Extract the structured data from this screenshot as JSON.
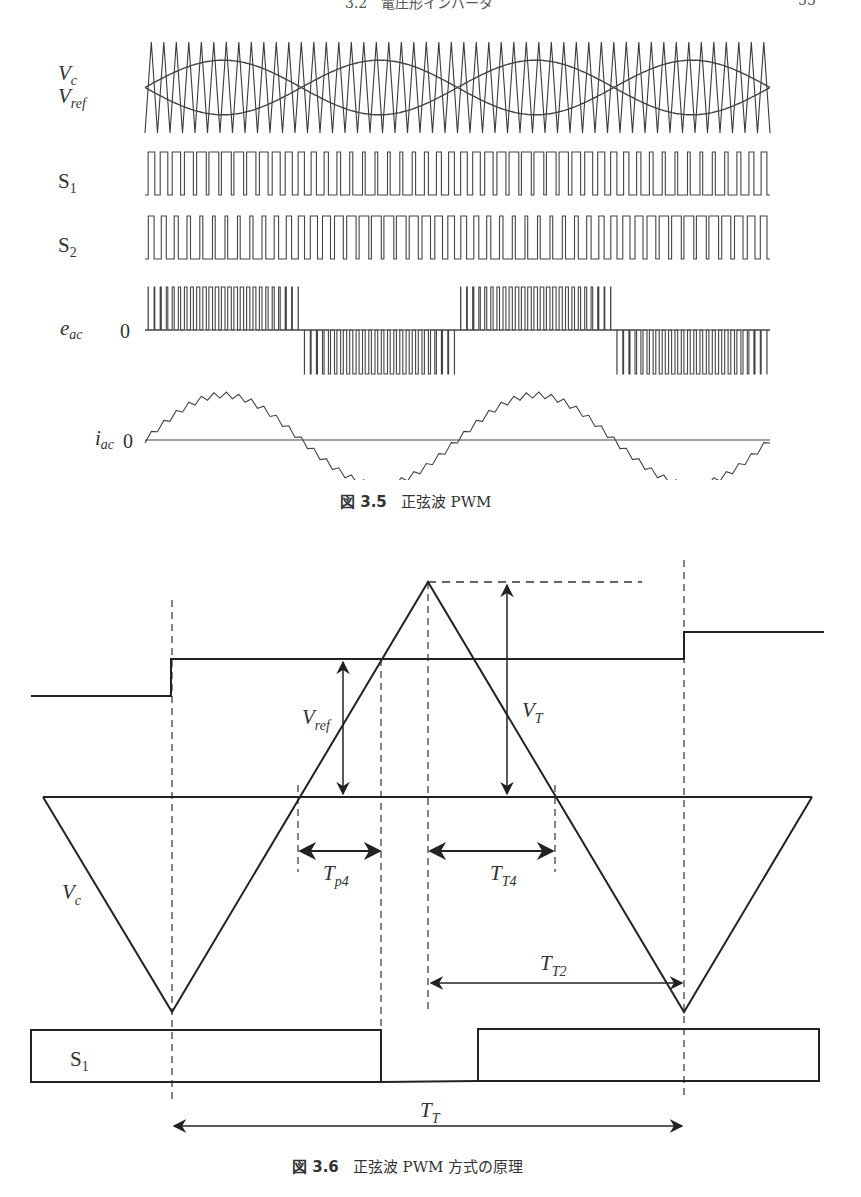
{
  "page_header": {
    "section": "3.2　電圧形インバータ",
    "page_number": "55"
  },
  "figure_3_5": {
    "caption_number": "図 3.5",
    "caption_text": "正弦波 PWM",
    "labels": {
      "vc": "V",
      "vc_sub": "c",
      "vref": "V",
      "vref_sub": "ref",
      "s1": "S",
      "s1_sub": "1",
      "s2": "S",
      "s2_sub": "2",
      "eac": "e",
      "eac_sub": "ac",
      "eac_zero": "0",
      "iac": "i",
      "iac_sub": "ac",
      "iac_zero": "0"
    },
    "waveform_params": {
      "x_start": 145,
      "x_end": 770,
      "fundamental_periods": 2,
      "carrier_cycles": 50,
      "modulation_index": 0.6,
      "phase_offset_deg": 0
    },
    "rows": {
      "carrier": {
        "top": 42,
        "bottom": 133
      },
      "s1": {
        "top": 152,
        "bottom": 195
      },
      "s2": {
        "top": 216,
        "bottom": 259
      },
      "eac": {
        "top": 287,
        "zero": 330,
        "bottom": 374
      },
      "iac": {
        "zero": 440,
        "amplitude": 45,
        "ripple": 6
      }
    }
  },
  "figure_3_6": {
    "caption_number": "図 3.6",
    "caption_text": "正弦波 PWM 方式の原理",
    "labels": {
      "vref": "V",
      "vref_sub": "ref",
      "vt": "V",
      "vt_sub": "T",
      "vc": "V",
      "vc_sub": "c",
      "tp4": "T",
      "tp4_sub": "p4",
      "tt4": "T",
      "tt4_sub": "T4",
      "tt2": "T",
      "tt2_sub": "T2",
      "tt": "T",
      "tt_sub": "T",
      "s1": "S",
      "s1_sub": "1"
    },
    "geometry": {
      "step_levels": [
        {
          "x1": 31,
          "x2": 171,
          "y": 696
        },
        {
          "x1": 171,
          "x2": 684,
          "y": 659
        },
        {
          "x1": 684,
          "x2": 824,
          "y": 632
        }
      ],
      "carrier_baseline": {
        "x1": 43,
        "x2": 812,
        "y": 797
      },
      "carrier_points": [
        [
          43,
          797
        ],
        [
          172,
          1012
        ],
        [
          428,
          582
        ],
        [
          684,
          1012
        ],
        [
          812,
          797
        ]
      ],
      "peak_dashed": {
        "x1": 428,
        "x2": 642,
        "y": 582
      },
      "dashed_verticals": [
        {
          "x": 172,
          "y1": 600,
          "y2": 1100
        },
        {
          "x": 684,
          "y1": 560,
          "y2": 1100
        },
        {
          "x": 428,
          "y1": 582,
          "y2": 1012
        },
        {
          "x": 381,
          "y1": 659,
          "y2": 1030
        },
        {
          "x": 298,
          "y1": 785,
          "y2": 872
        },
        {
          "x": 555,
          "y1": 785,
          "y2": 872
        }
      ],
      "s1_boxes": [
        {
          "x1": 31,
          "x2": 381,
          "top": 1030,
          "bottom": 1082
        },
        {
          "x1": 478,
          "x2": 819,
          "top": 1029,
          "bottom": 1081
        }
      ]
    }
  }
}
